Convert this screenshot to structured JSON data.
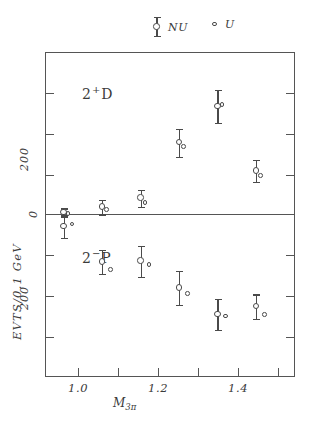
{
  "legend": {
    "entries": [
      {
        "marker": "errorbar-circle-marker",
        "label": "NU"
      },
      {
        "marker": "open-circle-marker",
        "label": "U"
      }
    ]
  },
  "axes": {
    "y_title": "EVTS/0.1 GeV",
    "x_title_main": "M",
    "x_title_sub": "3π",
    "y_tick_upper": "200",
    "y_tick_zero": "0",
    "y_tick_lower": "200",
    "x_ticks": [
      "1.0",
      "1.2",
      "1.4"
    ]
  },
  "panels": {
    "upper_label_main": "2",
    "upper_label_sup": "+",
    "upper_label_tail": "D",
    "lower_label_main": "2",
    "lower_label_sup": "−",
    "lower_label_tail": "P"
  },
  "chart_data": {
    "type": "scatter",
    "title": "",
    "xlabel": "M3π",
    "ylabel": "EVTS/0.1 GeV",
    "xlim": [
      0.9,
      1.55
    ],
    "ylim": [
      -400,
      400
    ],
    "note": "Two stacked half-panels sharing one axis: upper half is wave 2+D with counts plotted upward, lower half is wave 2-P with counts plotted downward. Zero line at panel centre.",
    "grid": false,
    "legend_position": "above-plot",
    "y_axis_ticks_upper": [
      0,
      100,
      200,
      300
    ],
    "y_axis_ticks_lower": [
      0,
      100,
      200,
      300
    ],
    "x_axis_ticks": [
      1.0,
      1.1,
      1.2,
      1.3,
      1.4,
      1.5
    ],
    "panels": [
      {
        "name": "2+D",
        "series": [
          {
            "name": "NU",
            "marker": "open circle with error bars",
            "points": [
              {
                "x": 0.95,
                "y": 5,
                "yerr": 10
              },
              {
                "x": 1.05,
                "y": 18,
                "yerr": 18
              },
              {
                "x": 1.15,
                "y": 40,
                "yerr": 22
              },
              {
                "x": 1.25,
                "y": 178,
                "yerr": 35
              },
              {
                "x": 1.35,
                "y": 268,
                "yerr": 40
              },
              {
                "x": 1.45,
                "y": 108,
                "yerr": 28
              }
            ]
          },
          {
            "name": "U",
            "marker": "small open circle",
            "points": [
              {
                "x": 0.96,
                "y": 2
              },
              {
                "x": 1.06,
                "y": 12
              },
              {
                "x": 1.16,
                "y": 30
              },
              {
                "x": 1.26,
                "y": 168
              },
              {
                "x": 1.36,
                "y": 272
              },
              {
                "x": 1.46,
                "y": 96
              }
            ]
          }
        ]
      },
      {
        "name": "2-P",
        "series": [
          {
            "name": "NU",
            "marker": "open circle with error bars",
            "points": [
              {
                "x": 0.95,
                "y": 30,
                "yerr": 28
              },
              {
                "x": 1.05,
                "y": 118,
                "yerr": 30
              },
              {
                "x": 1.15,
                "y": 116,
                "yerr": 38
              },
              {
                "x": 1.25,
                "y": 182,
                "yerr": 42
              },
              {
                "x": 1.35,
                "y": 248,
                "yerr": 38
              },
              {
                "x": 1.45,
                "y": 228,
                "yerr": 30
              }
            ]
          },
          {
            "name": "U",
            "marker": "small open circle",
            "points": [
              {
                "x": 0.97,
                "y": 24
              },
              {
                "x": 1.07,
                "y": 136
              },
              {
                "x": 1.17,
                "y": 124
              },
              {
                "x": 1.27,
                "y": 196
              },
              {
                "x": 1.37,
                "y": 252
              },
              {
                "x": 1.47,
                "y": 248
              }
            ]
          }
        ]
      }
    ]
  }
}
